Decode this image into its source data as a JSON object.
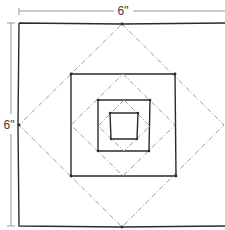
{
  "diagram": {
    "width_label": "6\"",
    "height_label": "6\"",
    "block_size_inches": 6,
    "solid_squares": 4,
    "dashed_diamonds": 3,
    "colors": {
      "solid_line": "#2b2b2b",
      "dashed_line": "#9e9e9e",
      "dimension_line": "#9a9a9a"
    }
  }
}
